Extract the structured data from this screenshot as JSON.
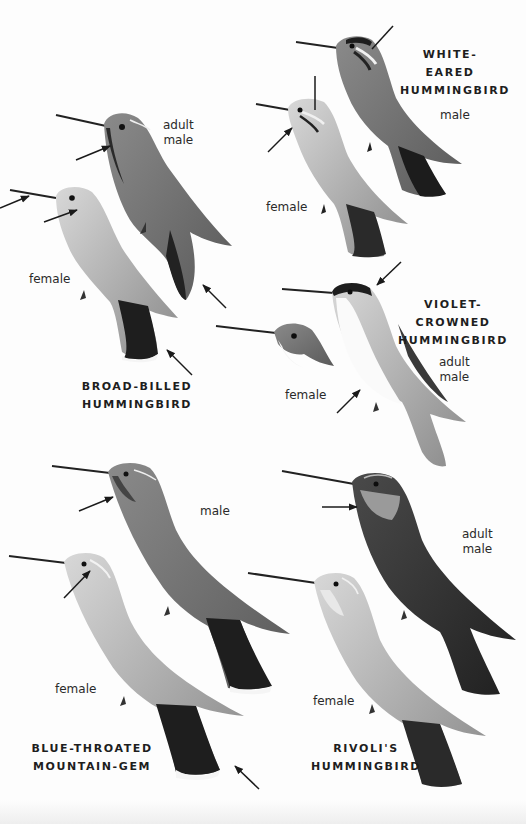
{
  "plate": {
    "species": [
      {
        "name_line1": "BROAD-BILLED",
        "name_line2": "HUMMINGBIRD",
        "labels": {
          "male": "adult",
          "male2": "male",
          "female": "female"
        }
      },
      {
        "name_line1": "WHITE-EARED",
        "name_line2": "HUMMINGBIRD",
        "labels": {
          "male": "male",
          "female": "female"
        }
      },
      {
        "name_line1": "VIOLET-CROWNED",
        "name_line2": "HUMMINGBIRD",
        "labels": {
          "male": "adult",
          "male2": "male",
          "female": "female"
        }
      },
      {
        "name_line1": "BLUE-THROATED",
        "name_line2": "MOUNTAIN-GEM",
        "labels": {
          "male": "male",
          "female": "female"
        }
      },
      {
        "name_line1": "RIVOLI'S",
        "name_line2": "HUMMINGBIRD",
        "labels": {
          "male": "adult",
          "male2": "male",
          "female": "female"
        }
      }
    ]
  }
}
